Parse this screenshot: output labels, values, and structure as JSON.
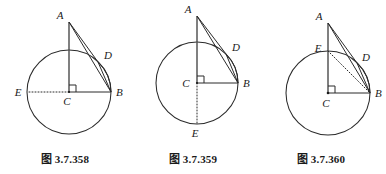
{
  "page": {
    "background_color": "#ffffff",
    "ink_color": "#2b2b2b",
    "width": 386,
    "height": 174,
    "kind": "geometry-figure-triptych"
  },
  "figures": [
    {
      "id": "fig-358",
      "caption": "图 3.7.358",
      "description": "Circle with center C; radius CB horizontal to the right; vertical line from C up through the circle to external point A; tangent-like segment A to D on the circle; chord and arc from D to B; dotted radius from C left to E on the circle; right-angle mark at C between CA and CB.",
      "circle": {
        "cx": 69,
        "cy": 92,
        "r": 42
      },
      "points": {
        "A": {
          "x": 69,
          "y": 22,
          "label": "A",
          "label_dx": -9,
          "label_dy": -3
        },
        "B": {
          "x": 111,
          "y": 92,
          "label": "B",
          "label_dx": 5,
          "label_dy": 4
        },
        "C": {
          "x": 69,
          "y": 92,
          "label": "C",
          "label_dx": -3,
          "label_dy": 13
        },
        "D": {
          "x": 98,
          "y": 62,
          "label": "D",
          "label_dx": 4,
          "label_dy": -3
        },
        "E": {
          "x": 27,
          "y": 92,
          "label": "E",
          "label_dx": -11,
          "label_dy": 4
        }
      },
      "segments": [
        {
          "from": "A",
          "to": "C",
          "style": "solid"
        },
        {
          "from": "A",
          "to": "D",
          "style": "solid"
        },
        {
          "from": "A",
          "to": "B",
          "style": "solid"
        },
        {
          "from": "D",
          "to": "B",
          "style": "solid"
        },
        {
          "from": "C",
          "to": "B",
          "style": "solid"
        },
        {
          "from": "C",
          "to": "E",
          "style": "dotted"
        }
      ],
      "arcs": [
        {
          "from": "D",
          "to": "B",
          "style": "solid"
        }
      ],
      "right_angle_at": "C"
    },
    {
      "id": "fig-359",
      "caption": "图 3.7.359",
      "description": "Circle with center C; radius CB horizontal to the right; vertical line from C up through the circle to external point A; segment A to D on the circle; chord and arc from D to B; dotted radius from C down to E at the bottom of the circle; right-angle mark at C.",
      "circle": {
        "cx": 197,
        "cy": 83,
        "r": 41
      },
      "points": {
        "A": {
          "x": 197,
          "y": 16,
          "label": "A",
          "label_dx": -9,
          "label_dy": -3
        },
        "B": {
          "x": 238,
          "y": 83,
          "label": "B",
          "label_dx": 5,
          "label_dy": 4
        },
        "C": {
          "x": 197,
          "y": 83,
          "label": "C",
          "label_dx": -11,
          "label_dy": 4
        },
        "D": {
          "x": 226,
          "y": 54,
          "label": "D",
          "label_dx": 4,
          "label_dy": -3
        },
        "E": {
          "x": 197,
          "y": 124,
          "label": "E",
          "label_dx": -3,
          "label_dy": 14
        }
      },
      "segments": [
        {
          "from": "A",
          "to": "C",
          "style": "solid"
        },
        {
          "from": "A",
          "to": "D",
          "style": "solid"
        },
        {
          "from": "A",
          "to": "B",
          "style": "solid"
        },
        {
          "from": "D",
          "to": "B",
          "style": "solid"
        },
        {
          "from": "C",
          "to": "B",
          "style": "solid"
        },
        {
          "from": "C",
          "to": "E",
          "style": "dotted"
        }
      ],
      "arcs": [
        {
          "from": "D",
          "to": "B",
          "style": "solid"
        }
      ],
      "right_angle_at": "C"
    },
    {
      "id": "fig-360",
      "caption": "图 3.7.360",
      "description": "Circle with center C; radius CB horizontal to the right; vertical line from C up through E on the circle to external point A; segment A to D on the circle; chord and arc from D to B; dotted chord from E to B; right-angle mark at C.",
      "circle": {
        "cx": 328,
        "cy": 93,
        "r": 42
      },
      "points": {
        "A": {
          "x": 328,
          "y": 23,
          "label": "A",
          "label_dx": -9,
          "label_dy": -3
        },
        "B": {
          "x": 370,
          "y": 93,
          "label": "B",
          "label_dx": 5,
          "label_dy": 4
        },
        "C": {
          "x": 328,
          "y": 93,
          "label": "C",
          "label_dx": -3,
          "label_dy": 14
        },
        "D": {
          "x": 357,
          "y": 63,
          "label": "D",
          "label_dx": 4,
          "label_dy": -2
        },
        "E": {
          "x": 328,
          "y": 51,
          "label": "E",
          "label_dx": -11,
          "label_dy": 0
        }
      },
      "segments": [
        {
          "from": "A",
          "to": "C",
          "style": "solid"
        },
        {
          "from": "A",
          "to": "D",
          "style": "solid"
        },
        {
          "from": "A",
          "to": "B",
          "style": "solid"
        },
        {
          "from": "D",
          "to": "B",
          "style": "solid"
        },
        {
          "from": "C",
          "to": "B",
          "style": "solid"
        },
        {
          "from": "E",
          "to": "B",
          "style": "dotted"
        }
      ],
      "arcs": [
        {
          "from": "D",
          "to": "B",
          "style": "solid"
        }
      ],
      "right_angle_at": "C"
    }
  ]
}
